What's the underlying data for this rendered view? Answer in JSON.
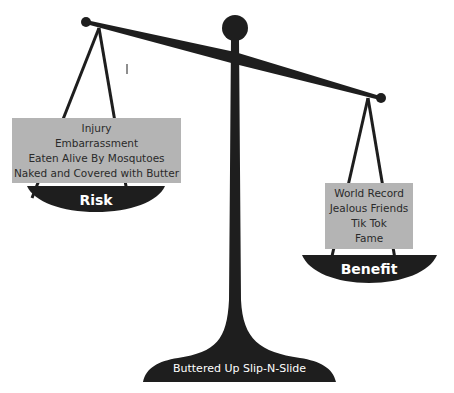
{
  "diagram": {
    "type": "balance-scale",
    "colors": {
      "ink": "#1e1e1e",
      "box": "#b4b4b4",
      "label_text": "#ffffff"
    },
    "left": {
      "pan_label": "Risk",
      "items": [
        "Injury",
        "Embarrassment",
        "Eaten Alive By Mosqutoes",
        "Naked and Covered with Butter"
      ]
    },
    "right": {
      "pan_label": "Benefit",
      "items": [
        "World Record",
        "Jealous Friends",
        "Tik Tok",
        "Fame"
      ]
    },
    "base_label": "Buttered Up Slip-N-Slide"
  }
}
